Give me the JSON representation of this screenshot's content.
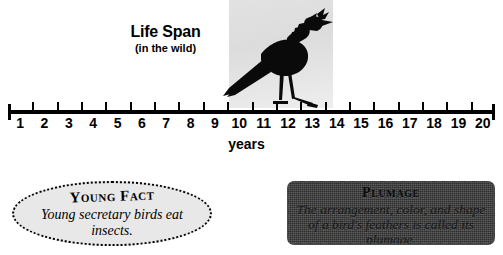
{
  "chart_data": {
    "type": "line",
    "title": "Life Span",
    "subtitle": "(in the wild)",
    "xlabel": "years",
    "ylabel": "",
    "xlim": [
      0,
      20
    ],
    "grid": false,
    "legend": null,
    "categories": [
      "1",
      "2",
      "3",
      "4",
      "5",
      "6",
      "7",
      "8",
      "9",
      "10",
      "11",
      "12",
      "13",
      "14",
      "15",
      "16",
      "17",
      "18",
      "19",
      "20"
    ],
    "values": [
      1,
      2,
      3,
      4,
      5,
      6,
      7,
      8,
      9,
      10,
      11,
      12,
      13,
      14,
      15,
      16,
      17,
      18,
      19,
      20
    ],
    "annotations": [
      {
        "label": "secretary bird life span band",
        "x_start": 9,
        "x_end": 14
      }
    ]
  },
  "header": {
    "title": "Life Span",
    "subtitle": "(in the wild)"
  },
  "numberline": {
    "axis_label": "years",
    "ticks": [
      "1",
      "2",
      "3",
      "4",
      "5",
      "6",
      "7",
      "8",
      "9",
      "10",
      "11",
      "12",
      "13",
      "14",
      "15",
      "16",
      "17",
      "18",
      "19",
      "20"
    ]
  },
  "illustration": {
    "subject": "secretary-bird-silhouette",
    "panel_color": "#e0e0e0"
  },
  "young_fact": {
    "title": "Young Fact",
    "body": "Young secretary birds eat insects.",
    "fill_color": "#e8e8e8"
  },
  "plumage": {
    "title": "Plumage",
    "body": "The arrangement, color, and shape of a bird's feathers is called its plumage.",
    "fill_color": "#3a3a3a"
  }
}
